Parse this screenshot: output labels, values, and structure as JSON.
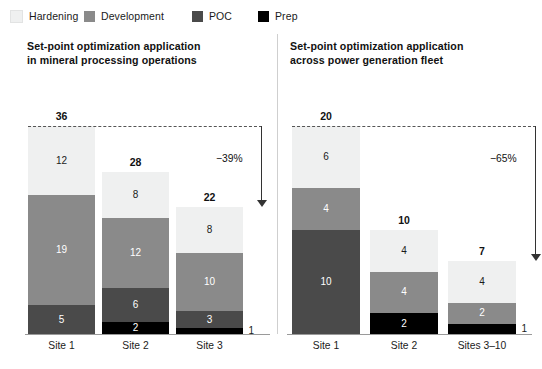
{
  "legend": {
    "items": [
      {
        "label": "Hardening",
        "color": "#eff0f0",
        "key": "hardening"
      },
      {
        "label": "Development",
        "color": "#8a8a8a",
        "key": "development"
      },
      {
        "label": "POC",
        "color": "#4a4a4a",
        "key": "poc"
      },
      {
        "label": "Prep",
        "color": "#000000",
        "key": "prep"
      }
    ]
  },
  "chart_data": [
    {
      "type": "bar",
      "subtype": "stacked",
      "title": "Set-point optimization application\nin mineral processing operations",
      "title_line1": "Set-point optimization application",
      "title_line2": "in mineral processing operations",
      "xlabel": "",
      "ylabel": "",
      "ylim": [
        0,
        36
      ],
      "grid": false,
      "legend_position": "top",
      "categories": [
        "Site 1",
        "Site 2",
        "Site 3"
      ],
      "totals": [
        36,
        28,
        22
      ],
      "series": [
        {
          "name": "Hardening",
          "values": [
            12,
            8,
            8
          ]
        },
        {
          "name": "Development",
          "values": [
            19,
            12,
            10
          ]
        },
        {
          "name": "POC",
          "values": [
            5,
            6,
            3
          ]
        },
        {
          "name": "Prep",
          "values": [
            0,
            2,
            1
          ]
        }
      ],
      "annotation": {
        "label": "−39%",
        "from_total": 36,
        "to_total": 22,
        "reference_line": "dashed"
      }
    },
    {
      "type": "bar",
      "subtype": "stacked",
      "title": "Set-point optimization application\nacross power generation fleet",
      "title_line1": "Set-point optimization application",
      "title_line2": "across power generation fleet",
      "xlabel": "",
      "ylabel": "",
      "ylim": [
        0,
        20
      ],
      "grid": false,
      "legend_position": "top",
      "categories": [
        "Site 1",
        "Site 2",
        "Sites 3–10"
      ],
      "totals": [
        20,
        10,
        7
      ],
      "series": [
        {
          "name": "Hardening",
          "values": [
            6,
            4,
            4
          ]
        },
        {
          "name": "Development",
          "values": [
            4,
            4,
            2
          ]
        },
        {
          "name": "POC",
          "values": [
            10,
            0,
            0
          ]
        },
        {
          "name": "Prep",
          "values": [
            0,
            2,
            1
          ]
        }
      ],
      "annotation": {
        "label": "−65%",
        "from_total": 20,
        "to_total": 7,
        "reference_line": "dashed"
      }
    }
  ]
}
